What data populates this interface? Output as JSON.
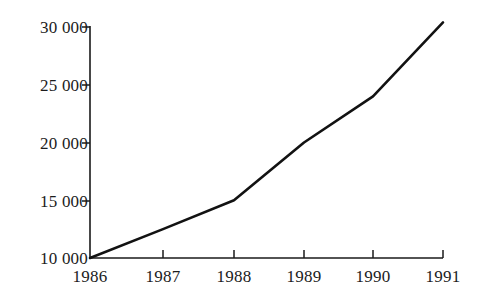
{
  "chart_data": {
    "type": "line",
    "title": "",
    "xlabel": "",
    "ylabel": "",
    "x": [
      1986,
      1987,
      1988,
      1989,
      1990,
      1991
    ],
    "categories": [
      "1986",
      "1987",
      "1988",
      "1989",
      "1990",
      "1991"
    ],
    "values": [
      10000,
      12500,
      15000,
      20000,
      24000,
      30400
    ],
    "series": [
      {
        "name": "",
        "values": [
          10000,
          12500,
          15000,
          20000,
          24000,
          30400
        ]
      }
    ],
    "xlim": [
      1986,
      1991
    ],
    "ylim": [
      10000,
      30000
    ],
    "grid": false,
    "legend": false,
    "legend_position": "none",
    "line_color": "#121212",
    "background_color": "#ffffff",
    "y_ticks": [
      10000,
      15000,
      20000,
      25000,
      30000
    ],
    "y_tick_labels": [
      "10 000",
      "15 000",
      "20 000",
      "25 000",
      "30 000"
    ],
    "x_ticks": [
      1986,
      1987,
      1988,
      1989,
      1990,
      1991
    ],
    "x_tick_labels": [
      "1986",
      "1987",
      "1988",
      "1989",
      "1990",
      "1991"
    ]
  },
  "axes": {
    "y_labels": [
      {
        "text": "30 000",
        "top": 27
      },
      {
        "text": "25 000",
        "top": 85
      },
      {
        "text": "20 000",
        "top": 143
      },
      {
        "text": "15 000",
        "top": 201
      },
      {
        "text": "10 000",
        "top": 258
      }
    ],
    "x_labels": [
      {
        "text": "1986",
        "left": 90
      },
      {
        "text": "1987",
        "left": 163
      },
      {
        "text": "1988",
        "left": 234
      },
      {
        "text": "1989",
        "left": 304
      },
      {
        "text": "1990",
        "left": 373
      },
      {
        "text": "1991",
        "left": 443
      }
    ]
  }
}
